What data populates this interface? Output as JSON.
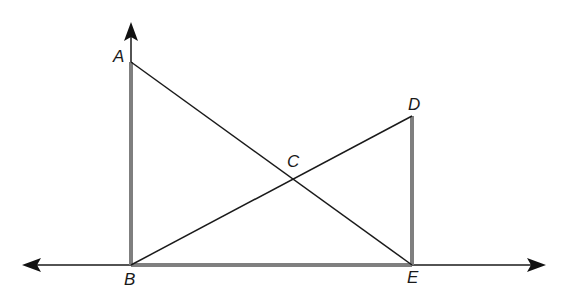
{
  "diagram": {
    "type": "geometry",
    "labels": {
      "A": "A",
      "B": "B",
      "C": "C",
      "D": "D",
      "E": "E"
    },
    "points": {
      "A": [
        131,
        62
      ],
      "B": [
        131,
        265
      ],
      "C": [
        292,
        179
      ],
      "D": [
        412,
        116
      ],
      "E": [
        412,
        265
      ]
    },
    "segments": [
      {
        "from": "A",
        "to": "B",
        "style": "thick-gray"
      },
      {
        "from": "D",
        "to": "E",
        "style": "thick-gray"
      },
      {
        "from": "B",
        "to": "E",
        "style": "thick-gray"
      },
      {
        "from": "A",
        "to": "E",
        "style": "thin-black"
      },
      {
        "from": "B",
        "to": "D",
        "style": "thin-black"
      }
    ],
    "lines": [
      {
        "name": "horizontal-line-BE",
        "arrows": "both"
      },
      {
        "name": "vertical-ray-BA",
        "arrows": "up"
      }
    ],
    "colors": {
      "thick": "#7f7f7f",
      "thin": "#1a1a1a"
    }
  }
}
